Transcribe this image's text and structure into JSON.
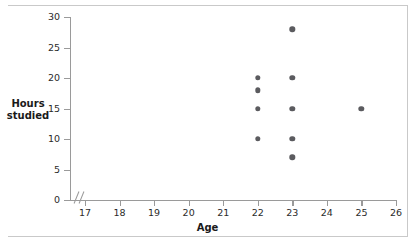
{
  "chart_data": {
    "type": "scatter",
    "title": "",
    "xlabel": "Age",
    "ylabel": "Hours studied",
    "xlim": [
      16.5,
      26
    ],
    "ylim": [
      0,
      30
    ],
    "xticks": [
      17,
      18,
      19,
      20,
      21,
      22,
      23,
      24,
      25,
      26
    ],
    "yticks": [
      0,
      5,
      10,
      15,
      20,
      25,
      30
    ],
    "grid": false,
    "legend": null,
    "axis_break": "x-axis break between origin and 17",
    "marker_color": "#5b5b5f",
    "axis_color": "#9a9a9a",
    "points": [
      {
        "x": 22,
        "y": 20
      },
      {
        "x": 22,
        "y": 18
      },
      {
        "x": 22,
        "y": 15
      },
      {
        "x": 22,
        "y": 10
      },
      {
        "x": 23,
        "y": 28
      },
      {
        "x": 23,
        "y": 20
      },
      {
        "x": 23,
        "y": 15
      },
      {
        "x": 23,
        "y": 10
      },
      {
        "x": 23,
        "y": 7
      },
      {
        "x": 25,
        "y": 15
      }
    ]
  },
  "axes": {
    "x_title": "Age",
    "y_title": "Hours\nstudied",
    "x_tick_labels": [
      "17",
      "18",
      "19",
      "20",
      "21",
      "22",
      "23",
      "24",
      "25",
      "26"
    ],
    "y_tick_labels": [
      "0",
      "5",
      "10",
      "15",
      "20",
      "25",
      "30"
    ]
  }
}
